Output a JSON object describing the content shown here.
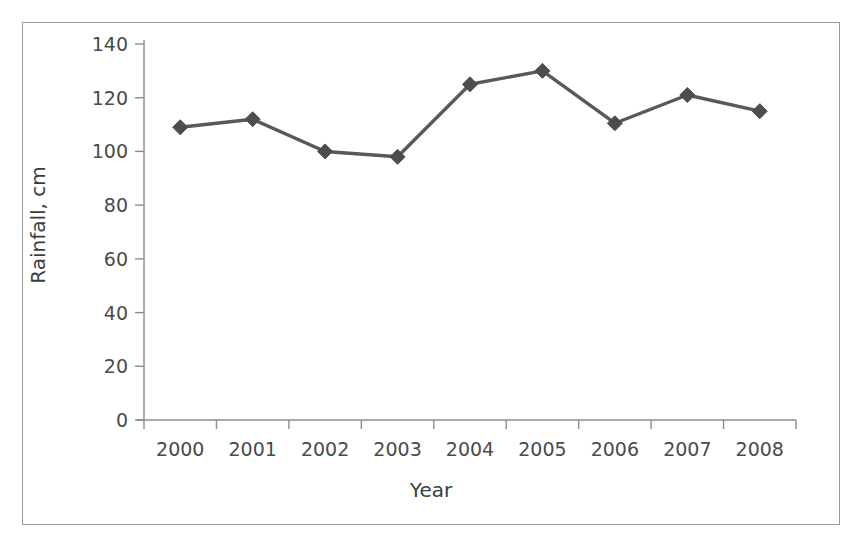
{
  "chart_data": {
    "type": "line",
    "title": "",
    "xlabel": "Year",
    "ylabel": "Rainfall, cm",
    "categories": [
      "2000",
      "2001",
      "2002",
      "2003",
      "2004",
      "2005",
      "2006",
      "2007",
      "2008"
    ],
    "values": [
      109,
      112,
      100,
      98,
      125,
      130,
      110.5,
      121,
      115
    ],
    "series": [
      {
        "name": "Rainfall",
        "values": [
          109,
          112,
          100,
          98,
          125,
          130,
          110.5,
          121,
          115
        ]
      }
    ],
    "ylim": [
      0,
      140
    ],
    "y_ticks": [
      "0",
      "20",
      "40",
      "60",
      "80",
      "100",
      "120",
      "140"
    ],
    "y_tick_values": [
      0,
      20,
      40,
      60,
      80,
      100,
      120,
      140
    ],
    "x_ticks": [
      "2000",
      "2001",
      "2002",
      "2003",
      "2004",
      "2005",
      "2006",
      "2007",
      "2008"
    ],
    "grid": false,
    "legend": "none",
    "marker": "diamond",
    "line_color": "#595959",
    "marker_color": "#4d4d4d",
    "axis_color": "#8c8c8c",
    "text_color": "#4a4a4a",
    "border_color": "#9a9a9a",
    "background_color": "#ffffff"
  }
}
